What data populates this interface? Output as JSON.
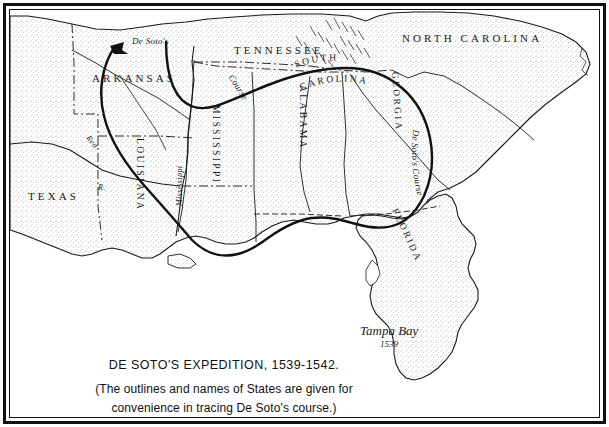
{
  "map": {
    "title": "DE SOTO'S EXPEDITION, 1539-1542.",
    "subtitle_line1": "(The outlines and names of States are given for",
    "subtitle_line2": "convenience in tracing De Soto's course.)",
    "ink_color": "#1a1a1a",
    "paper_color": "#ffffff",
    "states": [
      {
        "name": "TEXAS",
        "orientation": "horizontal"
      },
      {
        "name": "ARKANSAS",
        "orientation": "horizontal"
      },
      {
        "name": "TENNESSEE",
        "orientation": "horizontal"
      },
      {
        "name": "NORTH CAROLINA",
        "orientation": "horizontal"
      },
      {
        "name": "SOUTH CAROLINA",
        "orientation": "arched"
      },
      {
        "name": "LOUISIANA",
        "orientation": "vertical"
      },
      {
        "name": "MISSISSIPPI",
        "orientation": "vertical"
      },
      {
        "name": "ALABAMA",
        "orientation": "vertical"
      },
      {
        "name": "GEORGIA",
        "orientation": "vertical"
      },
      {
        "name": "FLORIDA",
        "orientation": "vertical"
      }
    ],
    "rivers": [
      {
        "label": "Red",
        "kind": "river-name"
      },
      {
        "label": "R.",
        "kind": "river-abbrev"
      },
      {
        "label": "Mississippi",
        "kind": "river-name"
      }
    ],
    "route": {
      "name": "De Soto's Course",
      "label_west": "De Soto's",
      "label_west_2": "Course",
      "label_east": "De Soto's Course",
      "arrow_direction": "west"
    },
    "places": [
      {
        "label": "Tampa Bay",
        "year": "1539"
      }
    ]
  }
}
